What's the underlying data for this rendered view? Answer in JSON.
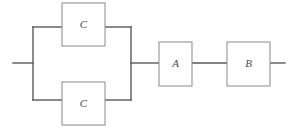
{
  "diagram": {
    "type": "reliability-block-diagram",
    "title": "",
    "canvas": {
      "width": 291,
      "height": 133,
      "background": "#ffffff"
    },
    "colors": {
      "block_stroke": "#8a8a8a",
      "block_fill": "#ffffff",
      "wire": "#5a5a5a",
      "label": "#4a4a4a"
    },
    "blocks": [
      {
        "id": "c-top",
        "label": "C",
        "x": 62,
        "y": 3,
        "width": 43,
        "height": 43
      },
      {
        "id": "c-bottom",
        "label": "C",
        "x": 62,
        "y": 82,
        "width": 43,
        "height": 43
      },
      {
        "id": "a",
        "label": "A",
        "x": 159,
        "y": 42,
        "width": 33,
        "height": 44
      },
      {
        "id": "b",
        "label": "B",
        "x": 227,
        "y": 42,
        "width": 43,
        "height": 44
      }
    ],
    "wires": [
      {
        "id": "input-lead",
        "points": "13,63 33,63"
      },
      {
        "id": "left-rail",
        "points": "33,27 33,100"
      },
      {
        "id": "top-branch-left",
        "points": "33,27 62,27"
      },
      {
        "id": "top-branch-right",
        "points": "105,27 131,27"
      },
      {
        "id": "bottom-branch-left",
        "points": "33,100 62,100"
      },
      {
        "id": "bottom-branch-right",
        "points": "105,100 131,100"
      },
      {
        "id": "right-rail",
        "points": "131,27 131,100"
      },
      {
        "id": "rail-to-a",
        "points": "131,63 159,63"
      },
      {
        "id": "a-to-b",
        "points": "192,63 227,63"
      },
      {
        "id": "output-lead",
        "points": "270,63 285,63"
      }
    ],
    "structure": {
      "parallel_group": [
        "C",
        "C"
      ],
      "series_after": [
        "A",
        "B"
      ]
    }
  }
}
